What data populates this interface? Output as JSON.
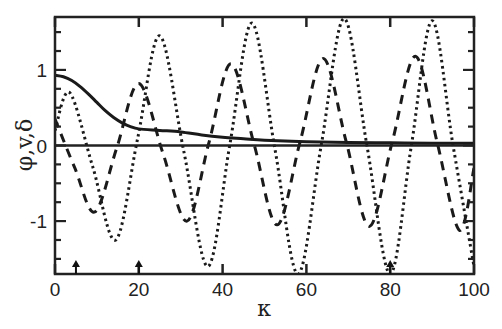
{
  "chart_data": {
    "type": "line",
    "title": "",
    "xlabel": "κ",
    "ylabel": "φ,v,δ",
    "xlim": [
      0,
      100
    ],
    "ylim": [
      -1.7,
      1.7
    ],
    "x_ticks": [
      0,
      20,
      40,
      60,
      80,
      100
    ],
    "x_tick_labels": [
      "0",
      "20",
      "40",
      "60",
      "80",
      "100"
    ],
    "y_ticks": [
      -1,
      0,
      1
    ],
    "y_tick_labels": [
      "-1",
      "0",
      "1"
    ],
    "grid": false,
    "legend": null,
    "zero_line": true,
    "annotations": [
      {
        "type": "arrow-up",
        "x": 5,
        "label": ""
      },
      {
        "type": "arrow-up",
        "x": 20,
        "label": ""
      },
      {
        "type": "arrow-up",
        "x": 80,
        "label": ""
      }
    ],
    "series": [
      {
        "name": "solid",
        "style": "solid",
        "x": [
          0,
          2,
          4,
          6,
          8,
          10,
          12,
          14,
          16,
          18,
          20,
          25,
          30,
          35,
          40,
          45,
          50,
          60,
          70,
          80,
          90,
          100
        ],
        "y": [
          0.93,
          0.91,
          0.86,
          0.78,
          0.68,
          0.57,
          0.46,
          0.37,
          0.3,
          0.25,
          0.22,
          0.2,
          0.18,
          0.14,
          0.11,
          0.09,
          0.07,
          0.05,
          0.04,
          0.035,
          0.03,
          0.03
        ]
      },
      {
        "name": "dashed",
        "style": "dashed",
        "x": [
          0,
          4.75,
          9.5,
          14.75,
          20,
          25.75,
          31.5,
          36.75,
          42,
          47.5,
          53,
          58.5,
          64,
          69.5,
          75,
          80.5,
          86,
          91.25,
          96.5,
          100
        ],
        "y": [
          0.35,
          -0.3,
          -0.88,
          -0.03,
          0.82,
          -0.1,
          -1.0,
          0.04,
          1.08,
          0.02,
          -1.05,
          0.05,
          1.15,
          0.05,
          -1.07,
          0.05,
          1.18,
          0.03,
          -1.12,
          -0.3
        ]
      },
      {
        "name": "dotted",
        "style": "dotted",
        "x": [
          0,
          3.5,
          9,
          14.5,
          19.75,
          25,
          30.75,
          36.5,
          41.75,
          47,
          52.5,
          58,
          63.5,
          69,
          74.5,
          80,
          85,
          90,
          95,
          100
        ],
        "y": [
          0.2,
          0.7,
          -0.28,
          -1.25,
          0.1,
          1.45,
          -0.08,
          -1.6,
          0.02,
          1.62,
          -0.05,
          -1.7,
          -0.01,
          1.68,
          -0.02,
          -1.7,
          -0.02,
          1.65,
          0.0,
          -1.6
        ]
      }
    ]
  }
}
